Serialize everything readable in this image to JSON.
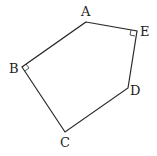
{
  "diagram": {
    "type": "pentagon",
    "stroke_color": "#2a2a2a",
    "vertices": [
      {
        "name": "A",
        "x": 86,
        "y": 22,
        "label_x": 83,
        "label_y": 14
      },
      {
        "name": "E",
        "x": 137,
        "y": 31,
        "label_x": 145,
        "label_y": 35
      },
      {
        "name": "D",
        "x": 128,
        "y": 88,
        "label_x": 137,
        "label_y": 94
      },
      {
        "name": "C",
        "x": 65,
        "y": 132,
        "label_x": 64,
        "label_y": 148
      },
      {
        "name": "B",
        "x": 22,
        "y": 67,
        "label_x": 14,
        "label_y": 72
      }
    ],
    "right_angles": [
      "B",
      "E"
    ],
    "labels": {
      "A": "A",
      "B": "B",
      "C": "C",
      "D": "D",
      "E": "E"
    }
  }
}
